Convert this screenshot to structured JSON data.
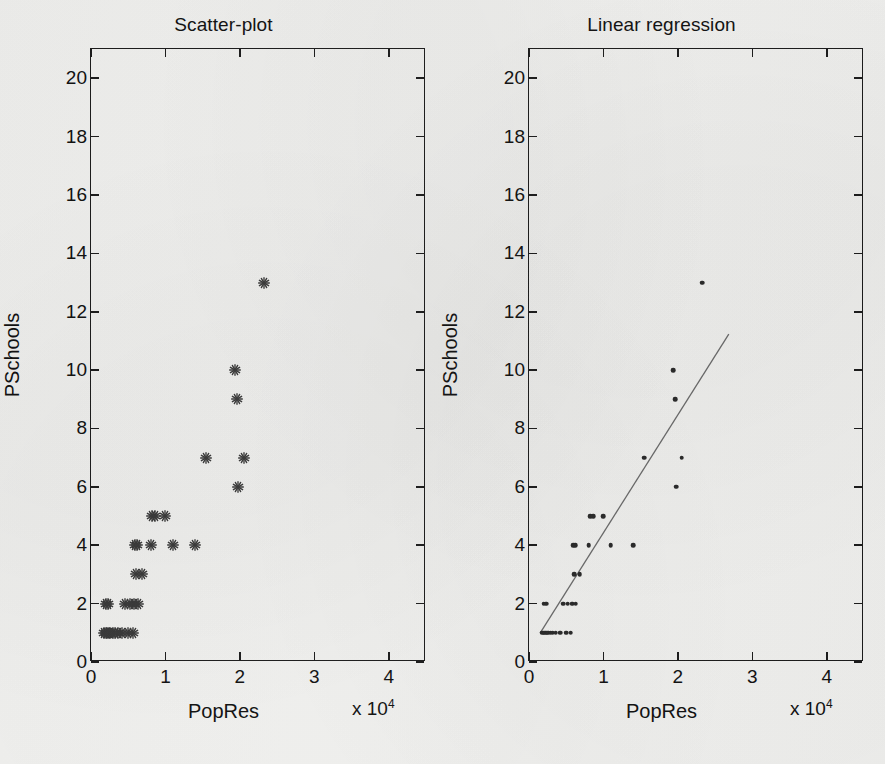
{
  "figure": {
    "axis_name_x": "PopRes",
    "axis_name_y": "PSchools",
    "exponent_label": "x 10",
    "exponent_sup": "4"
  },
  "panels": [
    {
      "id": "left",
      "title": "Scatter-plot"
    },
    {
      "id": "right",
      "title": "Linear regression"
    }
  ],
  "axes": {
    "xlim": [
      0,
      45000
    ],
    "ylim": [
      0,
      21
    ],
    "xticks": [
      0,
      10000,
      20000,
      30000,
      40000
    ],
    "xticklabels": [
      "0",
      "1",
      "2",
      "3",
      "4"
    ],
    "yticks": [
      0,
      2,
      4,
      6,
      8,
      10,
      12,
      14,
      16,
      18,
      20
    ],
    "yticklabels": [
      "0",
      "2",
      "4",
      "6",
      "8",
      "10",
      "12",
      "14",
      "16",
      "18",
      "20"
    ],
    "grid": false,
    "x_scale_factor": 10000
  },
  "chart_data": [
    {
      "type": "scatter",
      "title": "Scatter-plot",
      "xlabel": "PopRes",
      "ylabel": "PSchools",
      "xlim": [
        0,
        45000
      ],
      "ylim": [
        0,
        21
      ],
      "grid": false,
      "legend": null,
      "marker": "asterisk",
      "marker_color": "#3a3a3a",
      "x": [
        1800,
        2000,
        2200,
        2400,
        2600,
        2900,
        3200,
        3600,
        4200,
        5000,
        5600,
        2000,
        2300,
        4600,
        5200,
        5800,
        6300,
        6100,
        6800,
        5900,
        6200,
        8000,
        11000,
        14000,
        8200,
        8600,
        10000,
        15500,
        20500,
        19800,
        19600,
        19400,
        23300
      ],
      "y": [
        1,
        1,
        1,
        1,
        1,
        1,
        1,
        1,
        1,
        1,
        1,
        2,
        2,
        2,
        2,
        2,
        2,
        3,
        3,
        4,
        4,
        4,
        4,
        4,
        5,
        5,
        5,
        7,
        7,
        6,
        9,
        10,
        13
      ]
    },
    {
      "type": "scatter",
      "title": "Linear regression",
      "xlabel": "PopRes",
      "ylabel": "PSchools",
      "xlim": [
        0,
        45000
      ],
      "ylim": [
        0,
        21
      ],
      "grid": false,
      "legend": null,
      "marker": "point",
      "marker_color": "#2a2a2a",
      "x": [
        1800,
        2000,
        2200,
        2400,
        2600,
        2900,
        3200,
        3600,
        4200,
        5000,
        5600,
        2000,
        2300,
        4600,
        5200,
        5800,
        6300,
        6100,
        6800,
        5900,
        6200,
        8000,
        11000,
        14000,
        8200,
        8600,
        10000,
        15500,
        20500,
        19800,
        19600,
        19400,
        23300
      ],
      "y": [
        1,
        1,
        1,
        1,
        1,
        1,
        1,
        1,
        1,
        1,
        1,
        2,
        2,
        2,
        2,
        2,
        2,
        3,
        3,
        4,
        4,
        4,
        4,
        4,
        5,
        5,
        5,
        7,
        7,
        6,
        9,
        10,
        13
      ],
      "fit_line": {
        "type": "line",
        "color": "#6b6b6b",
        "x": [
          1500,
          27000
        ],
        "y": [
          0.9,
          11.2
        ]
      }
    }
  ]
}
